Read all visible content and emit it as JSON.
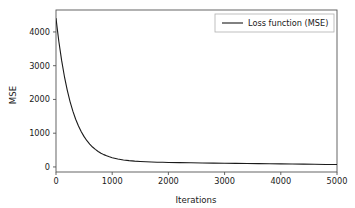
{
  "chart_data": {
    "type": "line",
    "title": "",
    "xlabel": "Iterations",
    "ylabel": "MSE",
    "xlim": [
      0,
      5000
    ],
    "ylim": [
      -150,
      4650
    ],
    "grid": false,
    "legend_position": "upper right",
    "xticks": [
      0,
      1000,
      2000,
      3000,
      4000,
      5000
    ],
    "xticklabels": [
      "0",
      "1000",
      "2000",
      "3000",
      "4000",
      "5000"
    ],
    "yticks": [
      0,
      1000,
      2000,
      3000,
      4000
    ],
    "yticklabels": [
      "0",
      "1000",
      "2000",
      "3000",
      "4000"
    ],
    "series": [
      {
        "name": "Loss function (MSE)",
        "color": "#1a1a1a",
        "linewidth": 1.1,
        "x": [
          0,
          50,
          100,
          150,
          200,
          250,
          300,
          350,
          400,
          450,
          500,
          550,
          600,
          650,
          700,
          750,
          800,
          850,
          900,
          950,
          1000,
          1100,
          1200,
          1300,
          1400,
          1500,
          1600,
          1700,
          1800,
          1900,
          2000,
          2200,
          2400,
          2600,
          2800,
          3000,
          3200,
          3400,
          3600,
          3800,
          4000,
          4200,
          4400,
          4600,
          4800,
          5000
        ],
        "y": [
          4400,
          3725,
          3157,
          2679,
          2277,
          1938,
          1653,
          1413,
          1211,
          1041,
          898,
          777,
          676,
          590,
          519,
          458,
          408,
          365,
          330,
          300,
          275,
          235,
          207,
          187,
          172,
          161,
          153,
          146,
          141,
          137,
          133,
          127,
          122,
          118,
          114,
          110,
          106,
          102,
          98,
          94,
          90,
          86,
          82,
          78,
          74,
          70
        ]
      }
    ]
  },
  "legend": {
    "entries": [
      {
        "label": "Loss function (MSE)",
        "color": "#1a1a1a"
      }
    ]
  },
  "axes": {
    "x_title": "Iterations",
    "y_title": "MSE"
  }
}
